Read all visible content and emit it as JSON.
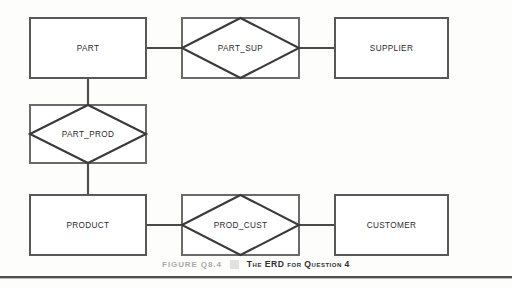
{
  "figure": {
    "caption_label": "FIGURE Q8.4",
    "caption_title": "The ERD for Question 4",
    "separator_color": "#e2e2e2",
    "background_color": "#fdfdfb",
    "line_color": "#4a4a4a",
    "text_color": "#2b2b2b"
  },
  "diagram": {
    "type": "entity-relationship-diagram",
    "notation": "chen-with-composite-entities",
    "entities": [
      {
        "id": "part",
        "label": "PART",
        "shape": "rectangle",
        "x": 30,
        "y": 18,
        "w": 116,
        "h": 60
      },
      {
        "id": "supplier",
        "label": "SUPPLIER",
        "shape": "rectangle",
        "x": 335,
        "y": 18,
        "w": 113,
        "h": 60
      },
      {
        "id": "product",
        "label": "PRODUCT",
        "shape": "rectangle",
        "x": 30,
        "y": 195,
        "w": 116,
        "h": 60
      },
      {
        "id": "customer",
        "label": "CUSTOMER",
        "shape": "rectangle",
        "x": 335,
        "y": 195,
        "w": 113,
        "h": 60
      }
    ],
    "composite_entities": [
      {
        "id": "part_sup",
        "label": "PART_SUP",
        "shape": "diamond-in-rectangle",
        "x": 182,
        "y": 18,
        "w": 117,
        "h": 60
      },
      {
        "id": "part_prod",
        "label": "PART_PROD",
        "shape": "diamond-in-rectangle",
        "x": 30,
        "y": 105,
        "w": 116,
        "h": 58
      },
      {
        "id": "prod_cust",
        "label": "PROD_CUST",
        "shape": "diamond-in-rectangle",
        "x": 182,
        "y": 195,
        "w": 117,
        "h": 60
      }
    ],
    "connections": [
      {
        "from": "part",
        "to": "part_sup",
        "orientation": "horizontal"
      },
      {
        "from": "part_sup",
        "to": "supplier",
        "orientation": "horizontal"
      },
      {
        "from": "part",
        "to": "part_prod",
        "orientation": "vertical"
      },
      {
        "from": "part_prod",
        "to": "product",
        "orientation": "vertical"
      },
      {
        "from": "product",
        "to": "prod_cust",
        "orientation": "horizontal"
      },
      {
        "from": "prod_cust",
        "to": "customer",
        "orientation": "horizontal"
      }
    ]
  }
}
